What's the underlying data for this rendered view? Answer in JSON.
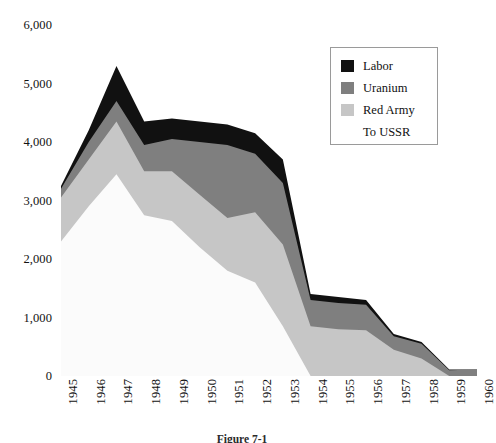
{
  "chart_data": {
    "type": "area",
    "stacked": true,
    "title": "",
    "subtitle": "",
    "xlabel": "",
    "ylabel": "",
    "grid": false,
    "legend_position": "top-right",
    "categories": [
      "1945",
      "1946",
      "1947",
      "1948",
      "1949",
      "1950",
      "1951",
      "1952",
      "1953",
      "1954",
      "1955",
      "1956",
      "1957",
      "1958",
      "1959",
      "1960"
    ],
    "x_tick_labels": [
      "1945",
      "1946",
      "1947",
      "1948",
      "1949",
      "1950",
      "1951",
      "1952",
      "1953",
      "1954",
      "1955",
      "1956",
      "1957",
      "1958",
      "1959",
      "1960"
    ],
    "y_tick_labels": [
      "6,000",
      "5,000",
      "4,000",
      "3,000",
      "2,000",
      "1,000",
      "0"
    ],
    "y_tick_values": [
      6000,
      5000,
      4000,
      3000,
      2000,
      1000,
      0
    ],
    "ylim": [
      0,
      6000
    ],
    "series": [
      {
        "name": "To USSR",
        "color": "#fbfbfb",
        "values": [
          2300,
          2900,
          3450,
          2750,
          2650,
          2200,
          1800,
          1600,
          850,
          0,
          0,
          0,
          0,
          0,
          0,
          0
        ]
      },
      {
        "name": "Red Army",
        "color": "#c6c6c6",
        "values": [
          750,
          800,
          900,
          750,
          850,
          900,
          900,
          1200,
          1400,
          850,
          800,
          780,
          450,
          300,
          0,
          0
        ]
      },
      {
        "name": "Uranium",
        "color": "#7f7f7f",
        "values": [
          150,
          300,
          350,
          450,
          550,
          900,
          1250,
          1000,
          1050,
          450,
          450,
          440,
          230,
          250,
          100,
          110
        ]
      },
      {
        "name": "Labor",
        "color": "#111111",
        "values": [
          50,
          200,
          600,
          400,
          350,
          350,
          350,
          350,
          400,
          100,
          100,
          80,
          40,
          30,
          10,
          0
        ]
      }
    ],
    "cumulative_tops": {
      "to_ussr": [
        2300,
        2900,
        3450,
        2750,
        2650,
        2200,
        1800,
        1600,
        850,
        0,
        0,
        0,
        0,
        0,
        0,
        0
      ],
      "red_army": [
        3050,
        3700,
        4350,
        3500,
        3500,
        3100,
        2700,
        2800,
        2250,
        850,
        800,
        780,
        450,
        300,
        0,
        0
      ],
      "uranium": [
        3200,
        4000,
        4700,
        3950,
        4050,
        4000,
        3950,
        3800,
        3300,
        1300,
        1250,
        1220,
        680,
        550,
        100,
        110
      ],
      "total": [
        3250,
        4200,
        5300,
        4350,
        4400,
        4350,
        4300,
        4150,
        3700,
        1400,
        1350,
        1300,
        720,
        580,
        110,
        110
      ]
    }
  },
  "legend": {
    "entries": [
      {
        "label": "Labor",
        "swatch": "#111111",
        "has_swatch": true
      },
      {
        "label": "Uranium",
        "swatch": "#7f7f7f",
        "has_swatch": true
      },
      {
        "label": "Red Army",
        "swatch": "#c6c6c6",
        "has_swatch": true
      },
      {
        "label": "To USSR",
        "swatch": "#ffffff",
        "has_swatch": false
      }
    ]
  },
  "caption": {
    "text": "Figure 7-1"
  }
}
